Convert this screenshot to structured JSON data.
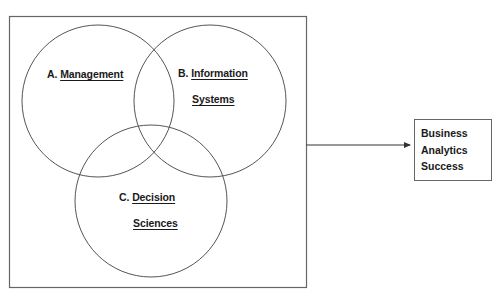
{
  "diagram": {
    "type": "venn-to-outcome",
    "colors": {
      "stroke": "#555555",
      "box_stroke": "#666666",
      "text": "#1a1a1a",
      "background": "#ffffff"
    },
    "sets": [
      {
        "id": "A",
        "prefix": "A.",
        "line1": "Management",
        "line2": ""
      },
      {
        "id": "B",
        "prefix": "B.",
        "line1": "Information",
        "line2": "Systems"
      },
      {
        "id": "C",
        "prefix": "C.",
        "line1": "Decision",
        "line2": "Sciences"
      }
    ],
    "outcome": {
      "lines": [
        "Business",
        "Analytics",
        "Success"
      ]
    },
    "edges": [
      {
        "from": "venn-container",
        "to": "outcome-box",
        "style": "arrow"
      }
    ]
  }
}
